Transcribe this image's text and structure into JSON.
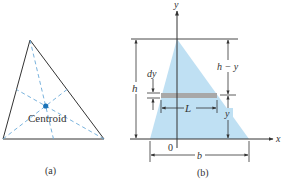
{
  "figure_a": {
    "caption": "(a)",
    "centroid_label": "Centroid",
    "colors": {
      "outline": "#333333",
      "medians": "#6aa9d8",
      "centroid_dot": "#1a73b8"
    }
  },
  "figure_b": {
    "caption": "(b)",
    "axis_x_label": "x",
    "axis_y_label": "y",
    "origin_label": "0",
    "height_label": "h",
    "top_segment_label": "h − y",
    "bottom_segment_label": "y",
    "strip_thickness_label": "dy",
    "strip_length_label": "L",
    "base_label": "b",
    "colors": {
      "fill": "#bfe0f3",
      "strip": "#a8a8a8",
      "lines": "#333333"
    }
  }
}
